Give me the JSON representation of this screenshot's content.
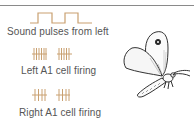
{
  "diagram": {
    "pulse_label": "Sound pulses from left",
    "left_label": "Left A1 cell firing",
    "right_label": "Right A1 cell firing",
    "pulse_count": 2,
    "left_spike_bursts": [
      6,
      5
    ],
    "right_spike_bursts": [
      4,
      4
    ],
    "colors": {
      "trace": "#c9a070",
      "text": "#555555",
      "rule": "#8a8a8a",
      "illustration": "#333333"
    },
    "illustration": "butterfly-moth"
  }
}
